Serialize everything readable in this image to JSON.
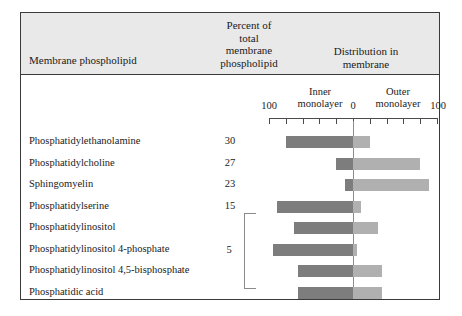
{
  "figure": {
    "headers": {
      "lipid": "Membrane phospholipid",
      "percent": "Percent of\ntotal\nmembrane\nphospholipid",
      "percent_lines": [
        "Percent of",
        "total",
        "membrane",
        "phospholipid"
      ],
      "distribution": "Distribution in\nmembrane",
      "distribution_lines": [
        "Distribution in",
        "membrane"
      ]
    },
    "axis": {
      "inner_label_lines": [
        "Inner",
        "monolayer"
      ],
      "outer_label_lines": [
        "Outer",
        "monolayer"
      ],
      "inner_label": "Inner monolayer",
      "outer_label": "Outer monolayer",
      "left_tick": "100",
      "zero_tick": "0",
      "right_tick": "100",
      "range_left": 100,
      "range_right": 100,
      "tick_interval": 20,
      "tick_count": 11
    },
    "group": {
      "value": "5",
      "bracket_rows": 4
    },
    "colors": {
      "inner_bar": "#7d7d7d",
      "outer_bar": "#b0b0b0",
      "header_band": "#e9e9e9",
      "frame": "#3a3a3a",
      "zero_line": "#8c8c8c"
    }
  },
  "chart_data": {
    "type": "bar",
    "title": "Distribution in membrane",
    "subtitle": "Membrane phospholipid distribution between inner and outer monolayer",
    "xlabel": "Percent of total for each phospholipid",
    "ylabel": "Membrane phospholipid",
    "orientation": "horizontal",
    "stacked": "diverging",
    "xlim": [
      -100,
      100
    ],
    "grid": false,
    "legend": [
      "Inner monolayer",
      "Outer monolayer"
    ],
    "legend_position": "top",
    "categories": [
      "Phosphatidylethanolamine",
      "Phosphatidylcholine",
      "Sphingomyelin",
      "Phosphatidylserine",
      "Phosphatidylinositol",
      "Phosphatidylinositol 4-phosphate",
      "Phosphatidylinositol 4,5-bisphosphate",
      "Phosphatidic acid"
    ],
    "percent_of_total": [
      "30",
      "27",
      "23",
      "15",
      "",
      "",
      "",
      ""
    ],
    "percent_group_value": "5",
    "series": [
      {
        "name": "Inner monolayer",
        "values": [
          80,
          20,
          10,
          90,
          70,
          95,
          65,
          65
        ]
      },
      {
        "name": "Outer monolayer",
        "values": [
          20,
          80,
          90,
          10,
          30,
          5,
          35,
          35
        ]
      }
    ],
    "rows": [
      {
        "label": "Phosphatidylethanolamine",
        "percent": "30",
        "inner": 80,
        "outer": 20
      },
      {
        "label": "Phosphatidylcholine",
        "percent": "27",
        "inner": 20,
        "outer": 80
      },
      {
        "label": "Sphingomyelin",
        "percent": "23",
        "inner": 10,
        "outer": 90
      },
      {
        "label": "Phosphatidylserine",
        "percent": "15",
        "inner": 90,
        "outer": 10
      },
      {
        "label": "Phosphatidylinositol",
        "percent": "",
        "inner": 70,
        "outer": 30
      },
      {
        "label": "Phosphatidylinositol 4-phosphate",
        "percent": "",
        "inner": 95,
        "outer": 5
      },
      {
        "label": "Phosphatidylinositol 4,5-bisphosphate",
        "percent": "",
        "inner": 65,
        "outer": 35
      },
      {
        "label": "Phosphatidic acid",
        "percent": "",
        "inner": 65,
        "outer": 35
      }
    ]
  }
}
